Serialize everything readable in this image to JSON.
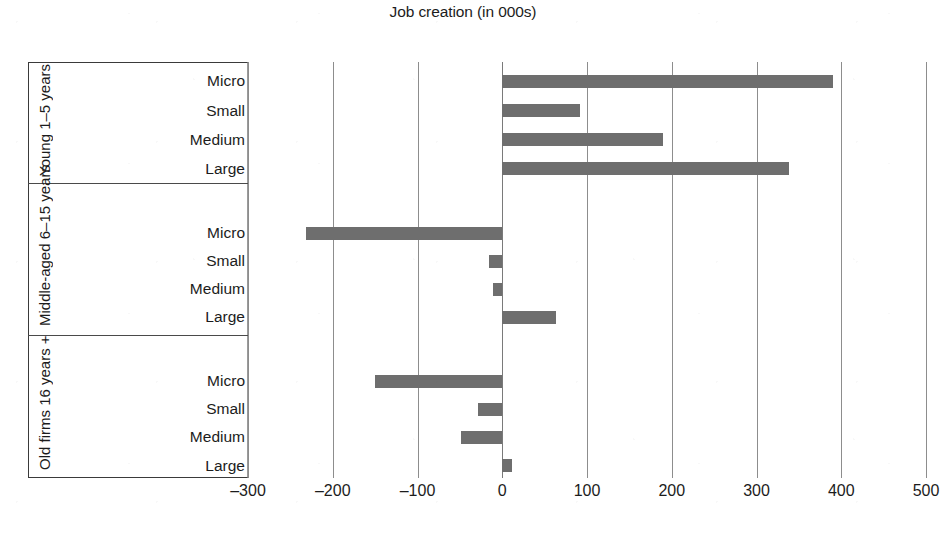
{
  "chart_data": {
    "type": "bar",
    "orientation": "horizontal",
    "title": "Job creation (in 000s)",
    "xlabel": "",
    "ylabel": "",
    "xlim": [
      -300,
      500
    ],
    "xticks": [
      -300,
      -200,
      -100,
      0,
      100,
      200,
      300,
      400,
      500
    ],
    "xtick_labels": [
      "–300",
      "–200",
      "–100",
      "0",
      "100",
      "200",
      "300",
      "400",
      "500"
    ],
    "grid": true,
    "legend": "none",
    "bar_color": "#6e6e6e",
    "groups": [
      {
        "name": "Young 1–5 years",
        "label_lines": [
          "Young 1–5",
          "years"
        ],
        "categories": [
          "Micro",
          "Small",
          "Medium",
          "Large"
        ],
        "values": [
          390,
          92,
          190,
          338
        ]
      },
      {
        "name": "Middle-aged 6–15 years",
        "label_lines": [
          "Middle-aged",
          "6–15 years"
        ],
        "categories": [
          "Micro",
          "Small",
          "Medium",
          "Large"
        ],
        "values": [
          -232,
          -16,
          -11,
          63
        ]
      },
      {
        "name": "Old firms 16 years +",
        "label_lines": [
          "Old firms 16",
          "years +"
        ],
        "categories": [
          "Micro",
          "Small",
          "Medium",
          "Large"
        ],
        "values": [
          -150,
          -29,
          -49,
          12
        ]
      }
    ]
  }
}
